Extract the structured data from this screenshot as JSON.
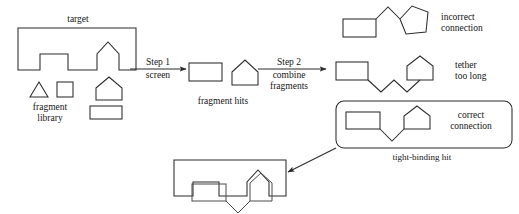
{
  "figure": {
    "type": "process-diagram",
    "domain": "fragment-based drug discovery schematic",
    "background_color": "#ffffff",
    "line_color": "#2b2b2b",
    "text_color": "#161616"
  },
  "labels": {
    "target": "target",
    "fragment_library": "fragment\nlibrary",
    "step1_title": "Step 1",
    "step1_subtitle": "screen",
    "fragment_hits": "fragment hits",
    "step2_title": "Step 2",
    "step2_subtitle": "combine\nfragments",
    "incorrect_connection": "incorrect\nconnection",
    "tether_too_long": "tether\ntoo long",
    "correct_connection": "correct\nconnection",
    "tight_binding_hit": "tight-binding hit"
  },
  "stages": [
    {
      "id": "target",
      "label": "target",
      "description": "Protein target drawn as a rectangle with two binding pockets notched into its lower edge: a flat square pocket on the left and a pentagon/house-shaped pocket on the right."
    },
    {
      "id": "fragment-library",
      "label": "fragment library",
      "shapes": [
        "triangle",
        "square",
        "pentagon",
        "rectangle"
      ],
      "description": "Four candidate fragment shapes shown below the target."
    },
    {
      "id": "step1",
      "title": "Step 1",
      "subtitle": "screen",
      "arrow": "right"
    },
    {
      "id": "fragment-hits",
      "label": "fragment hits",
      "shapes": [
        "rectangle",
        "pentagon"
      ],
      "description": "Two fragments that match the target pockets."
    },
    {
      "id": "step2",
      "title": "Step 2",
      "subtitle": "combine fragments",
      "arrow": "right"
    },
    {
      "id": "incorrect-connection",
      "label": "incorrect connection",
      "description": "Rectangle and pentagon joined by a tether attached at the wrong vertices, drawn with a peak between them."
    },
    {
      "id": "tether-too-long",
      "label": "tether too long",
      "description": "Rectangle and pentagon joined by an over-long zig-zag linker of three bonds."
    },
    {
      "id": "correct-connection",
      "label": "correct connection",
      "boxed": true,
      "caption": "tight-binding hit",
      "description": "Rectangle and pentagon joined by a short V-shaped tether, enclosed in a rounded rectangle."
    },
    {
      "id": "bound-complex",
      "description": "The correctly linked molecule docked into both pockets of the target protein."
    }
  ]
}
